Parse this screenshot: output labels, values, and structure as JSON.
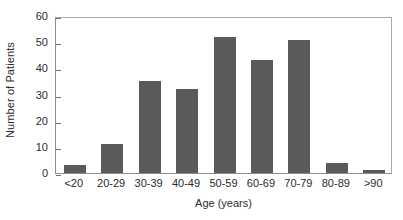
{
  "chart_data": {
    "type": "bar",
    "title": "",
    "subtitle": "",
    "xlabel": "Age (years)",
    "ylabel": "Number of Patients",
    "categories": [
      "<20",
      "20-29",
      "30-39",
      "40-49",
      "50-59",
      "60-69",
      "70-79",
      "80-89",
      ">90"
    ],
    "values": [
      3,
      11,
      35,
      32,
      52,
      43,
      51,
      4,
      1
    ],
    "series": [
      {
        "name": "Number of Patients",
        "values": [
          3,
          11,
          35,
          32,
          52,
          43,
          51,
          4,
          1
        ]
      }
    ],
    "ylim": [
      0,
      60
    ],
    "yticks": [
      0,
      10,
      20,
      30,
      40,
      50,
      60
    ],
    "ytick_labels": [
      "0",
      "10",
      "20",
      "30",
      "40",
      "50",
      "60"
    ],
    "grid": false,
    "legend": false,
    "legend_position": "none",
    "annotations": [],
    "bar_color": "#5a5a5a",
    "frame_color": "#a9a9a9",
    "background_color": "#ffffff",
    "text_color": "#2b2b2b"
  }
}
